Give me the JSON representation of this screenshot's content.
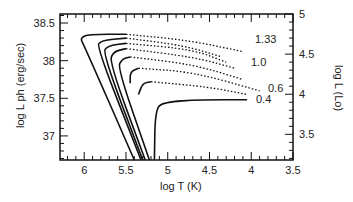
{
  "chart_data": {
    "type": "line",
    "title": "",
    "xlabel": "log T (K)",
    "ylabel": "log L ph (erg/sec)",
    "ylabel_right": "log L (Lo)",
    "xlim": [
      6.29,
      3.5
    ],
    "ylim": [
      36.68,
      38.62
    ],
    "ylim_right": [
      3.18,
      5.0
    ],
    "x_ticks": [
      "6",
      "5.5",
      "5",
      "4.5",
      "4",
      "3.5"
    ],
    "y_ticks": [
      "37",
      "37.5",
      "38",
      "38.5"
    ],
    "y_ticks_right": [
      "3.5",
      "4",
      "4.5",
      "5"
    ],
    "grid": false,
    "legend": "none",
    "annotations": [
      "1.33",
      "1.0",
      "0.6",
      "0.4"
    ],
    "series": [
      {
        "name": "1.33",
        "solid": [
          [
            5.4,
            36.68
          ],
          [
            6.0,
            38.2
          ],
          [
            6.05,
            38.3
          ],
          [
            5.95,
            38.35
          ],
          [
            5.5,
            38.35
          ]
        ],
        "dotted": [
          [
            5.5,
            38.35
          ],
          [
            4.75,
            38.27
          ],
          [
            4.1,
            38.12
          ]
        ]
      },
      {
        "name": "curve-2",
        "solid": [
          [
            5.32,
            36.68
          ],
          [
            5.85,
            38.18
          ],
          [
            5.8,
            38.27
          ],
          [
            5.5,
            38.3
          ]
        ],
        "dotted": [
          [
            5.5,
            38.3
          ],
          [
            4.8,
            38.2
          ],
          [
            4.35,
            38.05
          ]
        ]
      },
      {
        "name": "curve-3",
        "solid": [
          [
            5.3,
            36.68
          ],
          [
            5.78,
            38.1
          ],
          [
            5.72,
            38.2
          ],
          [
            5.5,
            38.23
          ]
        ],
        "dotted": [
          [
            5.5,
            38.23
          ],
          [
            4.7,
            38.15
          ],
          [
            4.3,
            37.98
          ]
        ]
      },
      {
        "name": "1.0",
        "solid": [
          [
            5.27,
            36.68
          ],
          [
            5.7,
            37.98
          ],
          [
            5.65,
            38.12
          ],
          [
            5.5,
            38.16
          ]
        ],
        "dotted": [
          [
            5.5,
            38.16
          ],
          [
            4.7,
            38.05
          ],
          [
            4.2,
            37.9
          ]
        ]
      },
      {
        "name": "curve-5",
        "solid": [
          [
            5.22,
            36.68
          ],
          [
            5.6,
            37.9
          ],
          [
            5.55,
            38.02
          ],
          [
            5.45,
            38.05
          ]
        ],
        "dotted": [
          [
            5.45,
            38.05
          ],
          [
            4.7,
            37.95
          ],
          [
            4.1,
            37.75
          ]
        ]
      },
      {
        "name": "0.6",
        "solid": [
          [
            5.45,
            37.7
          ],
          [
            5.45,
            37.85
          ],
          [
            5.35,
            37.9
          ]
        ],
        "dotted": [
          [
            5.35,
            37.9
          ],
          [
            4.7,
            37.85
          ],
          [
            3.9,
            37.6
          ]
        ]
      },
      {
        "name": "curve-7",
        "solid": [
          [
            5.35,
            37.55
          ],
          [
            5.3,
            37.7
          ],
          [
            5.2,
            37.72
          ]
        ],
        "dotted": [
          [
            5.2,
            37.72
          ],
          [
            4.5,
            37.65
          ],
          [
            4.05,
            37.55
          ]
        ]
      },
      {
        "name": "0.4",
        "solid": [
          [
            5.16,
            36.68
          ],
          [
            5.15,
            37.35
          ],
          [
            5.05,
            37.45
          ],
          [
            4.6,
            37.48
          ],
          [
            4.05,
            37.48
          ]
        ],
        "dotted": []
      }
    ]
  }
}
